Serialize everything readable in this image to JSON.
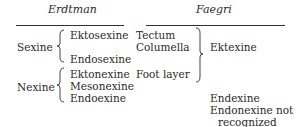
{
  "headers": {
    "left": "Erdtman",
    "right": "Faegri"
  },
  "erdtman": {
    "groups": [
      {
        "name": "Sexine",
        "items": [
          "Ektosexine",
          "Endosexine"
        ]
      },
      {
        "name": "Nexine",
        "items": [
          "Ektonexine",
          "Mesonexine",
          "Endoexine"
        ]
      }
    ]
  },
  "faegri": {
    "ektexine_parts": [
      "Tectum",
      "Columella",
      "Foot layer"
    ],
    "ektexine_label": "Ektexine",
    "endexine": "Endexine",
    "note_line1": "Endonexine not",
    "note_line2": "recognized"
  }
}
